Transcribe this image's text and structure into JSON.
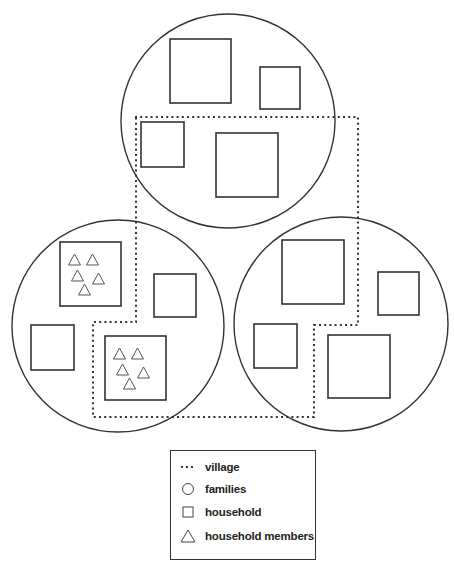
{
  "legend": {
    "items": [
      {
        "symbol": "dotted-line",
        "label": "village"
      },
      {
        "symbol": "circle",
        "label": "families"
      },
      {
        "symbol": "square",
        "label": "household"
      },
      {
        "symbol": "triangle",
        "label": "household members"
      }
    ]
  },
  "colors": {
    "stroke": "#333333",
    "background": "#ffffff"
  },
  "diagram": {
    "families": [
      {
        "id": "top",
        "cx": 228,
        "cy": 121,
        "r": 107
      },
      {
        "id": "left",
        "cx": 118,
        "cy": 326,
        "r": 106
      },
      {
        "id": "right",
        "cx": 341,
        "cy": 324,
        "r": 107
      }
    ],
    "households": [
      {
        "family": "top",
        "x": 170,
        "y": 39,
        "w": 61,
        "h": 64,
        "members": 0
      },
      {
        "family": "top",
        "x": 260,
        "y": 67,
        "w": 40,
        "h": 42,
        "members": 0
      },
      {
        "family": "top",
        "x": 141,
        "y": 122,
        "w": 43,
        "h": 45,
        "members": 0
      },
      {
        "family": "top",
        "x": 216,
        "y": 133,
        "w": 62,
        "h": 64,
        "members": 0
      },
      {
        "family": "left",
        "x": 60,
        "y": 242,
        "w": 61,
        "h": 64,
        "members": 5
      },
      {
        "family": "left",
        "x": 154,
        "y": 274,
        "w": 42,
        "h": 43,
        "members": 0
      },
      {
        "family": "left",
        "x": 31,
        "y": 325,
        "w": 43,
        "h": 45,
        "members": 0
      },
      {
        "family": "left",
        "x": 105,
        "y": 336,
        "w": 61,
        "h": 64,
        "members": 5
      },
      {
        "family": "right",
        "x": 282,
        "y": 240,
        "w": 62,
        "h": 64,
        "members": 0
      },
      {
        "family": "right",
        "x": 378,
        "y": 272,
        "w": 41,
        "h": 43,
        "members": 0
      },
      {
        "family": "right",
        "x": 254,
        "y": 324,
        "w": 43,
        "h": 44,
        "members": 0
      },
      {
        "family": "right",
        "x": 328,
        "y": 335,
        "w": 62,
        "h": 63,
        "members": 0
      }
    ],
    "village_boundary": "135,117 358,117 358,325 314,325 314,417 93,417 93,322 136,322 136,117"
  }
}
